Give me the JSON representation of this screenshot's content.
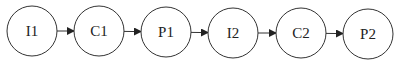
{
  "diagram": {
    "type": "flow",
    "nodes": [
      {
        "id": "I1",
        "label": "I1",
        "cx": 32,
        "cy": 31
      },
      {
        "id": "C1",
        "label": "C1",
        "cx": 99,
        "cy": 31
      },
      {
        "id": "P1",
        "label": "P1",
        "cx": 166,
        "cy": 32
      },
      {
        "id": "I2",
        "label": "I2",
        "cx": 233,
        "cy": 33
      },
      {
        "id": "C2",
        "label": "C2",
        "cx": 301,
        "cy": 33
      },
      {
        "id": "P2",
        "label": "P2",
        "cx": 368,
        "cy": 34
      }
    ],
    "edges": [
      {
        "from": "I1",
        "to": "C1"
      },
      {
        "from": "C1",
        "to": "P1"
      },
      {
        "from": "P1",
        "to": "I2"
      },
      {
        "from": "I2",
        "to": "C2"
      },
      {
        "from": "C2",
        "to": "P2"
      }
    ],
    "node_radius": 25,
    "stroke_color": "#333333",
    "background": "#ffffff"
  }
}
